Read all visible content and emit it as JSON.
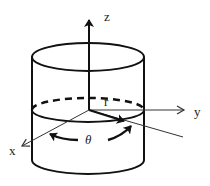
{
  "diagram": {
    "colors": {
      "stroke": "#111111",
      "background": "#ffffff"
    },
    "labels": {
      "z_axis": "z",
      "y_axis": "y",
      "x_axis": "x",
      "radius": "r",
      "angle": "θ"
    },
    "elements": [
      "cylinder-top-ellipse",
      "cylinder-side-walls",
      "cylinder-bottom-arc",
      "cross-section-ellipse (front solid, back dashed)",
      "z-axis-arrow",
      "y-axis-arrow",
      "x-axis-arrow",
      "radius-vector-r",
      "angle-theta-arrows"
    ]
  }
}
